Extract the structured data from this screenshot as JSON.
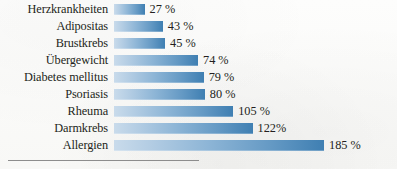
{
  "chart_data": {
    "type": "bar",
    "orientation": "horizontal",
    "title": "",
    "subtitle": "",
    "xlabel": "",
    "ylabel": "",
    "xlim": [
      0,
      185
    ],
    "grid": false,
    "legend": null,
    "unit": "%",
    "categories": [
      "Herzkrankheiten",
      "Adipositas",
      "Brustkrebs",
      "Übergewicht",
      "Diabetes mellitus",
      "Psoriasis",
      "Rheuma",
      "Darmkrebs",
      "Allergien"
    ],
    "values": [
      27,
      43,
      45,
      74,
      79,
      80,
      105,
      122,
      185
    ],
    "value_labels": [
      "27 %",
      "43 %",
      "45 %",
      "74 %",
      "79 %",
      "80 %",
      "105 %",
      "122%",
      "185 %"
    ],
    "bars": [
      {
        "category": "Herzkrankheiten",
        "value": 27,
        "label": "27 %"
      },
      {
        "category": "Adipositas",
        "value": 43,
        "label": "43 %"
      },
      {
        "category": "Brustkrebs",
        "value": 45,
        "label": "45 %"
      },
      {
        "category": "Übergewicht",
        "value": 74,
        "label": "74 %"
      },
      {
        "category": "Diabetes mellitus",
        "value": 79,
        "label": "79 %"
      },
      {
        "category": "Psoriasis",
        "value": 80,
        "label": "80 %"
      },
      {
        "category": "Rheuma",
        "value": 105,
        "label": "105 %"
      },
      {
        "category": "Darmkrebs",
        "value": 122,
        "label": "122%"
      },
      {
        "category": "Allergien",
        "value": 185,
        "label": "185 %"
      }
    ],
    "colors": {
      "bar_gradient_start": "#c9dbeb",
      "bar_gradient_end": "#3f7fb2",
      "text": "#231f20",
      "background": "#fbfbfa",
      "rule": "#8d8d8d"
    }
  }
}
